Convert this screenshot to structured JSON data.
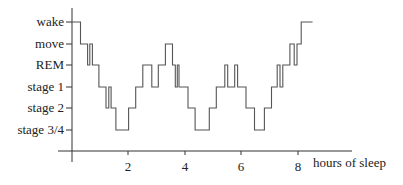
{
  "chart_data": {
    "type": "line",
    "subtype": "step (hypnogram)",
    "title": "",
    "xlabel": "hours of sleep",
    "ylabel": "",
    "x_ticks": [
      2,
      4,
      6,
      8
    ],
    "xlim": [
      0,
      9
    ],
    "y_categories": [
      "wake",
      "move",
      "REM",
      "stage 1",
      "stage 2",
      "stage 3/4"
    ],
    "grid": false,
    "legend": null,
    "series": [
      {
        "name": "sleep stage",
        "points": [
          [
            0.0,
            "wake"
          ],
          [
            0.3,
            "move"
          ],
          [
            0.55,
            "REM"
          ],
          [
            0.63,
            "move"
          ],
          [
            0.72,
            "REM"
          ],
          [
            0.95,
            "stage 1"
          ],
          [
            1.2,
            "stage 2"
          ],
          [
            1.3,
            "stage 1"
          ],
          [
            1.38,
            "stage 2"
          ],
          [
            1.55,
            "stage 3/4"
          ],
          [
            2.0,
            "stage 2"
          ],
          [
            2.25,
            "stage 1"
          ],
          [
            2.5,
            "REM"
          ],
          [
            2.82,
            "stage 1"
          ],
          [
            3.05,
            "REM"
          ],
          [
            3.3,
            "move"
          ],
          [
            3.55,
            "REM"
          ],
          [
            3.65,
            "stage 1"
          ],
          [
            3.72,
            "REM"
          ],
          [
            3.78,
            "stage 1"
          ],
          [
            4.1,
            "stage 2"
          ],
          [
            4.35,
            "stage 3/4"
          ],
          [
            4.85,
            "stage 2"
          ],
          [
            5.1,
            "stage 1"
          ],
          [
            5.4,
            "REM"
          ],
          [
            5.5,
            "stage 1"
          ],
          [
            5.75,
            "REM"
          ],
          [
            5.85,
            "stage 1"
          ],
          [
            6.15,
            "stage 2"
          ],
          [
            6.45,
            "stage 3/4"
          ],
          [
            6.8,
            "stage 2"
          ],
          [
            7.05,
            "stage 1"
          ],
          [
            7.25,
            "REM"
          ],
          [
            7.35,
            "stage 1"
          ],
          [
            7.45,
            "REM"
          ],
          [
            7.7,
            "move"
          ],
          [
            7.85,
            "REM"
          ],
          [
            7.95,
            "move"
          ],
          [
            8.1,
            "wake"
          ],
          [
            8.5,
            "wake"
          ]
        ]
      }
    ]
  },
  "axes": {
    "y_labels": [
      "wake",
      "move",
      "REM",
      "stage 1",
      "stage 2",
      "stage 3/4"
    ],
    "x_tick_labels": [
      "2",
      "4",
      "6",
      "8"
    ],
    "x_label": "hours of sleep"
  }
}
